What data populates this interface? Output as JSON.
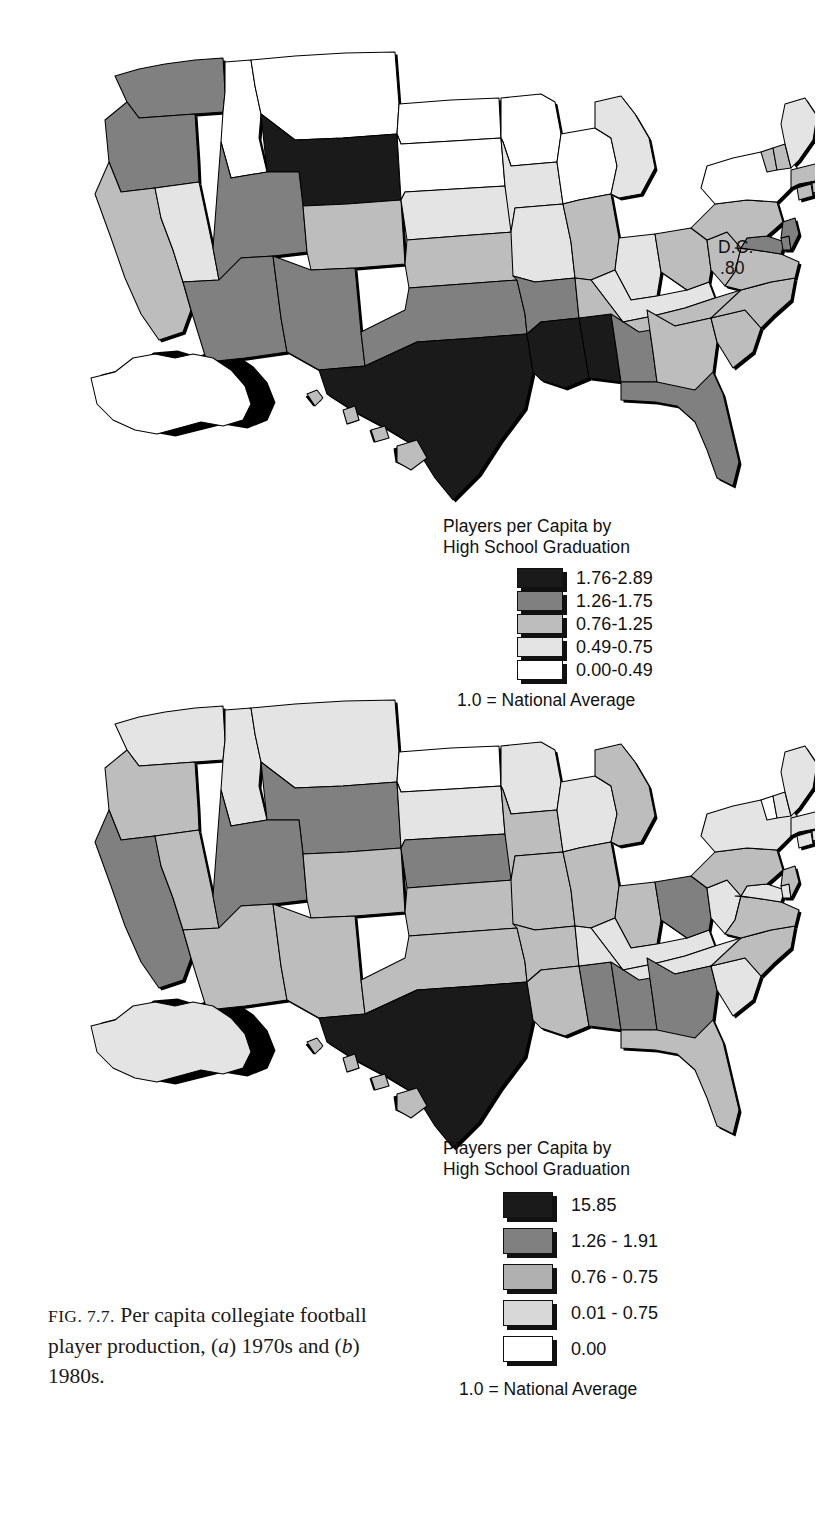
{
  "figure": {
    "caption_prefix": "FIG. 7.7.",
    "caption_body": "  Per capita collegiate football player production,",
    "caption_line3_a": "(",
    "caption_line3_a_italic": "a",
    "caption_line3_b": ") 1970s and (",
    "caption_line3_b_italic": "b",
    "caption_line3_c": ") 1980s.",
    "caption_full": "FIG. 7.7.  Per capita collegiate football player production, (a) 1970s and (b) 1980s."
  },
  "map_a": {
    "label": "(a) 1970s",
    "annotation_dc_label": "D.C.",
    "annotation_dc_value": ".80"
  },
  "map_b": {
    "label": "(b) 1980s"
  },
  "legend_a": {
    "title": "Players per Capita by\nHigh School Graduation",
    "footer": "1.0 = National Average",
    "items": [
      {
        "label": "1.76-2.89",
        "color": "#1a1a1a"
      },
      {
        "label": "1.26-1.75",
        "color": "#808080"
      },
      {
        "label": "0.76-1.25",
        "color": "#bdbdbd"
      },
      {
        "label": "0.49-0.75",
        "color": "#e4e4e4"
      },
      {
        "label": "0.00-0.49",
        "color": "#ffffff"
      }
    ]
  },
  "legend_b": {
    "title": "Players per Capita by\nHigh School Graduation",
    "footer": "1.0 = National Average",
    "items": [
      {
        "label": "15.85",
        "color": "#1a1a1a"
      },
      {
        "label": "1.26 - 1.91",
        "color": "#808080"
      },
      {
        "label": "0.76 - 0.75",
        "color": "#b0b0b0"
      },
      {
        "label": "0.01 - 0.75",
        "color": "#d8d8d8"
      },
      {
        "label": "0.00",
        "color": "#ffffff"
      }
    ]
  },
  "chart_data": {
    "type": "choropleth-map-pair",
    "title": "Per capita collegiate football player production",
    "subtitle": "(a) 1970s and (b) 1980s",
    "unit_note": "1.0 = National Average",
    "value_legend_label": "Players per Capita by High School Graduation",
    "palette": [
      "#1a1a1a",
      "#808080",
      "#bdbdbd",
      "#e4e4e4",
      "#ffffff"
    ],
    "maps": [
      {
        "panel": "a",
        "period": "1970s",
        "bins": [
          "1.76-2.89",
          "1.26-1.75",
          "0.76-1.25",
          "0.49-0.75",
          "0.00-0.49"
        ],
        "annotations": [
          {
            "name": "D.C.",
            "value": 0.8
          }
        ],
        "state_bins": {
          "WA": 1,
          "OR": 1,
          "CA": 2,
          "NV": 3,
          "ID": 4,
          "MT": 4,
          "WY": 0,
          "UT": 1,
          "AZ": 1,
          "CO": 2,
          "NM": 1,
          "ND": 4,
          "SD": 4,
          "NE": 3,
          "KS": 2,
          "OK": 1,
          "TX": 0,
          "MN": 4,
          "IA": 3,
          "MO": 3,
          "AR": 1,
          "LA": 0,
          "WI": 4,
          "IL": 2,
          "MS": 0,
          "AL": 1,
          "MI": 3,
          "IN": 3,
          "KY": 3,
          "TN": 2,
          "OH": 2,
          "WV": 2,
          "GA": 2,
          "FL": 1,
          "SC": 2,
          "NC": 2,
          "VA": 2,
          "MD": 1,
          "DE": 1,
          "PA": 2,
          "NJ": 1,
          "NY": 4,
          "CT": 2,
          "RI": 2,
          "MA": 2,
          "VT": 2,
          "NH": 2,
          "ME": 3,
          "AK": 4,
          "HI": 2
        }
      },
      {
        "panel": "b",
        "period": "1980s",
        "bins": [
          "15.85",
          "1.26 - 1.91",
          "0.76 - 0.75",
          "0.01 - 0.75",
          "0.00"
        ],
        "annotations": [],
        "state_bins": {
          "WA": 3,
          "OR": 2,
          "CA": 1,
          "NV": 2,
          "ID": 3,
          "MT": 3,
          "WY": 1,
          "UT": 1,
          "AZ": 2,
          "CO": 2,
          "NM": 2,
          "ND": 4,
          "SD": 3,
          "NE": 1,
          "KS": 2,
          "OK": 2,
          "TX": 0,
          "MN": 3,
          "IA": 2,
          "MO": 2,
          "AR": 2,
          "LA": 2,
          "WI": 3,
          "IL": 2,
          "MS": 1,
          "AL": 1,
          "MI": 2,
          "IN": 2,
          "KY": 3,
          "TN": 3,
          "OH": 1,
          "WV": 3,
          "GA": 1,
          "FL": 2,
          "SC": 3,
          "NC": 2,
          "VA": 2,
          "MD": 3,
          "DE": 3,
          "PA": 2,
          "NJ": 2,
          "NY": 3,
          "CT": 3,
          "RI": 3,
          "MA": 3,
          "VT": 4,
          "NH": 3,
          "ME": 3,
          "AK": 3,
          "HI": 2
        }
      }
    ]
  }
}
